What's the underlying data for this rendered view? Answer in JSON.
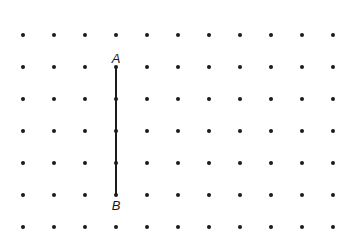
{
  "diagram": {
    "type": "dot-grid",
    "columns": 11,
    "rows": 7,
    "origin": {
      "x": 23,
      "y": 35
    },
    "spacing": {
      "x": 31,
      "y": 32
    },
    "dot_radius": 2,
    "dot_color": "#1a1a1a",
    "segment": {
      "from": {
        "col": 3,
        "row": 1,
        "label": "A"
      },
      "to": {
        "col": 3,
        "row": 5,
        "label": "B"
      },
      "color": "#1a1a1a",
      "width": 2
    }
  }
}
